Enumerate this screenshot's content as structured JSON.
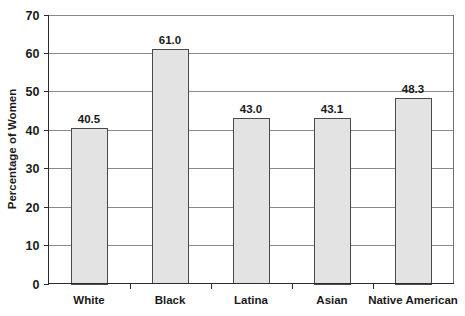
{
  "chart_data": {
    "type": "bar",
    "title": "",
    "subtitle": "",
    "xlabel": "",
    "ylabel": "Percentage of Women",
    "categories": [
      "White",
      "Black",
      "Latina",
      "Asian",
      "Native American"
    ],
    "values": [
      40.5,
      61.0,
      43.0,
      43.1,
      48.3
    ],
    "value_labels": [
      "40.5",
      "61.0",
      "43.0",
      "43.1",
      "48.3"
    ],
    "ylim": [
      0,
      70
    ],
    "ytick_labels": [
      "0",
      "10",
      "20",
      "30",
      "40",
      "50",
      "60",
      "70"
    ],
    "ytick_values": [
      0,
      10,
      20,
      30,
      40,
      50,
      60,
      70
    ],
    "grid": true,
    "grid_axis": "y",
    "legend": false,
    "legend_position": "none",
    "series": [
      {
        "name": "Percentage of Women",
        "values": [
          40.5,
          61.0,
          43.0,
          43.1,
          48.3
        ]
      }
    ]
  },
  "style": {
    "bar_fill": "#e3e3e3",
    "bar_stroke": "#4a4a4a",
    "grid_color": "#8a8a8a",
    "axis_color": "#2b2b2b",
    "frame_color": "#6f6f6f",
    "background": "#ffffff",
    "text_color": "#1a1a1a"
  }
}
